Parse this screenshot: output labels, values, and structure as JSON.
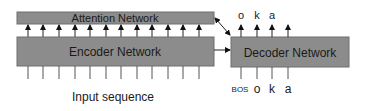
{
  "diagram": {
    "attention": {
      "label": "Attention Network",
      "fill": "#8c8c8c"
    },
    "encoder": {
      "label": "Encoder Network",
      "fill": "#8c8c8c"
    },
    "decoder": {
      "label": "Decoder Network",
      "fill": "#8c8c8c"
    },
    "input_label": "Input sequence",
    "encoder_input_count": 12,
    "encoder_to_attention_arrow_count": 12,
    "decoder_outputs": [
      "o",
      "k",
      "a"
    ],
    "decoder_inputs": [
      "BOS",
      "o",
      "k",
      "a"
    ]
  }
}
